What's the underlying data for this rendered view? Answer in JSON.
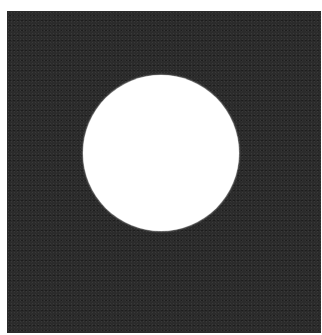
{
  "image": {
    "description": "Dark textured square with a single white circle centered slightly above middle",
    "background_color": "#ffffff",
    "square": {
      "color": "#2b2b2b",
      "texture": "fine grain noise"
    },
    "circle": {
      "color": "#ffffff",
      "diameter_px": 156
    }
  }
}
